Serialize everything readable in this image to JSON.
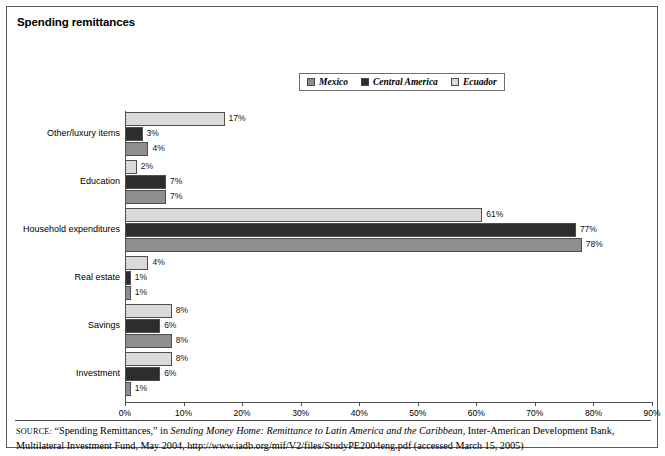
{
  "figure": {
    "title": "Spending remittances",
    "source_prefix": "SOURCE:",
    "source_part1": " “Spending Remittances,” in ",
    "source_italic": "Sending Money Home: Remittance to Latin America and the Caribbean",
    "source_part2": ", Inter-American Development Bank, Multilateral Investment Fund, May 2004, http://www.iadb.org/mif/V2/files/StudyPE2004eng.pdf (accessed March 15, 2005)"
  },
  "colors": {
    "mexico": "#8e8e8e",
    "central_america": "#2d2d2d",
    "ecuador": "#d9d9d9",
    "axis": "#4d4d4d",
    "frame": "#5a5a5a"
  },
  "legend": {
    "items": [
      {
        "label": "Mexico",
        "swatch": "#8e8e8e"
      },
      {
        "label": "Central America",
        "swatch": "#2d2d2d"
      },
      {
        "label": "Ecuador",
        "swatch": "#d9d9d9"
      }
    ]
  },
  "chart_data": {
    "type": "bar",
    "orientation": "horizontal",
    "title": "Spending remittances",
    "xlabel": "",
    "ylabel": "",
    "xlim": [
      0,
      90
    ],
    "xticks": [
      "0%",
      "10%",
      "20%",
      "30%",
      "40%",
      "50%",
      "60%",
      "70%",
      "80%",
      "90%"
    ],
    "xtick_values": [
      0,
      10,
      20,
      30,
      40,
      50,
      60,
      70,
      80,
      90
    ],
    "grid": false,
    "legend_position": "top-center",
    "categories": [
      "Other/luxury items",
      "Education",
      "Household expenditures",
      "Real estate",
      "Savings",
      "Investment"
    ],
    "series": [
      {
        "name": "Ecuador",
        "color": "#d9d9d9",
        "values": [
          17,
          2,
          61,
          4,
          8,
          8
        ],
        "labels": [
          "17%",
          "2%",
          "61%",
          "4%",
          "8%",
          "8%"
        ]
      },
      {
        "name": "Central America",
        "color": "#2d2d2d",
        "values": [
          3,
          7,
          77,
          1,
          6,
          6
        ],
        "labels": [
          "3%",
          "7%",
          "77%",
          "1%",
          "6%",
          "6%"
        ]
      },
      {
        "name": "Mexico",
        "color": "#8e8e8e",
        "values": [
          4,
          7,
          78,
          1,
          8,
          1
        ],
        "labels": [
          "4%",
          "7%",
          "78%",
          "1%",
          "8%",
          "1%"
        ]
      }
    ]
  }
}
